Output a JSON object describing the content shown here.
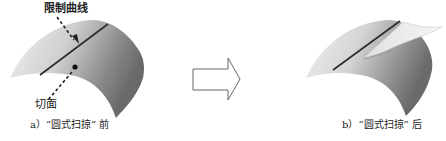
{
  "figure": {
    "panel_a": {
      "caption": "a）“圆式扫掠” 前",
      "labels": {
        "limit_curve": "限制曲线",
        "tangent_face": "切面"
      }
    },
    "panel_b": {
      "caption": "b）“圆式扫掠” 后"
    },
    "transition_arrow": "right-arrow-outline"
  },
  "colors": {
    "surface_light": "#ececec",
    "surface_dark": "#6e6e6e",
    "curve": "#2a2a2a",
    "arrow_outline": "#555555",
    "text": "#222222"
  }
}
